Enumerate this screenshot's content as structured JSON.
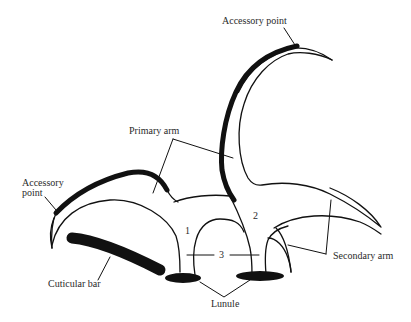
{
  "figure": {
    "colors": {
      "ink": "#111111",
      "text": "#2a2a2a",
      "background": "#ffffff"
    }
  },
  "labels": {
    "accessory_point_top": "Accessory point",
    "accessory_point_left_line1": "Accessory",
    "accessory_point_left_line2": "point",
    "primary_arm": "Primary arm",
    "secondary_arm": "Secondary arm",
    "cuticular_bar": "Cuticular bar",
    "lunule": "Lunule",
    "num_1": "1",
    "num_2": "2",
    "num_3": "3"
  }
}
